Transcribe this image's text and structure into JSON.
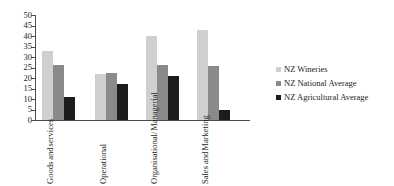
{
  "chart_data": {
    "type": "bar",
    "title": "",
    "xlabel": "",
    "ylabel": "",
    "ylim": [
      0,
      50
    ],
    "ytick_labels": [
      "50",
      "45",
      "40",
      "35",
      "30",
      "25",
      "20",
      "15",
      "10",
      "5",
      "0"
    ],
    "ytick_values": [
      50,
      45,
      40,
      35,
      30,
      25,
      20,
      15,
      10,
      5,
      0
    ],
    "grid": false,
    "legend_position": "right",
    "categories": [
      "Goods and services",
      "Operational",
      "Organisational/ Managerial",
      "Sales and Marketing"
    ],
    "category_lines": [
      [
        "Goods and",
        "services"
      ],
      [
        "Operational"
      ],
      [
        "Organisational/",
        "Managerial"
      ],
      [
        "Sales and",
        "Marketing"
      ]
    ],
    "series": [
      {
        "name": "NZ Wineries",
        "color": "#cfcfcf",
        "values": [
          33,
          22,
          40,
          43
        ]
      },
      {
        "name": "NZ National Average",
        "color": "#8a8a8a",
        "values": [
          26,
          22.5,
          26,
          25.5
        ]
      },
      {
        "name": "NZ Agricultural Average",
        "color": "#1c1c1c",
        "values": [
          11,
          17,
          21,
          5
        ]
      }
    ]
  },
  "legend": {
    "items": [
      {
        "label": "NZ Wineries"
      },
      {
        "label": "NZ National Average"
      },
      {
        "label": "NZ Agricultural Average"
      }
    ]
  }
}
